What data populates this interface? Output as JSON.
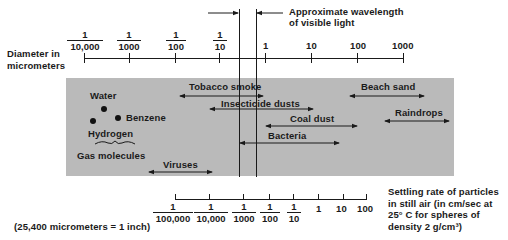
{
  "diagram": {
    "title_note": "Approximate wavelength of visible light",
    "title_note_lines": [
      "Approximate wavelength",
      "of visible light"
    ],
    "top_axis": {
      "label_lines": [
        "Diameter  in",
        "micrometers"
      ],
      "ticks": [
        {
          "num": "1",
          "den": "10,000"
        },
        {
          "num": "1",
          "den": "1000"
        },
        {
          "num": "1",
          "den": "100"
        },
        {
          "num": "1",
          "den": "10"
        },
        {
          "value": "1"
        },
        {
          "value": "10"
        },
        {
          "value": "100"
        },
        {
          "value": "1000"
        }
      ]
    },
    "particles": {
      "water": "Water",
      "benzene": "Benzene",
      "hydrogen": "Hydrogen",
      "gas_molecules": "Gas molecules",
      "tobacco_smoke": "Tobacco smoke",
      "insecticide_dusts": "Insecticide dusts",
      "coal_dust": "Coal dust",
      "bacteria": "Bacteria",
      "viruses": "Viruses",
      "beach_sand": "Beach sand",
      "raindrops": "Raindrops"
    },
    "bottom_axis": {
      "label_lines": [
        "Settling rate of particles",
        "in still air (in cm/sec at",
        "25° C for spheres of",
        "density 2 g/cm³)"
      ],
      "ticks": [
        {
          "num": "1",
          "den": "100,000"
        },
        {
          "num": "1",
          "den": "10,000"
        },
        {
          "num": "1",
          "den": "1000"
        },
        {
          "num": "1",
          "den": "100"
        },
        {
          "num": "1",
          "den": "10"
        },
        {
          "value": "1"
        },
        {
          "value": "10"
        },
        {
          "value": "100"
        }
      ]
    },
    "footnote": "(25,400 micrometers = 1 inch)",
    "colors": {
      "panel": "#bababa",
      "ink": "#1a1a1a",
      "background": "#ffffff"
    }
  }
}
